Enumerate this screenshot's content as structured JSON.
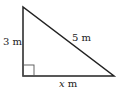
{
  "diagram": {
    "type": "right-triangle",
    "labels": {
      "vertical_side": "3 m",
      "hypotenuse": "5 m",
      "base_var": "x",
      "base_unit": " m"
    },
    "colors": {
      "stroke": "#222222",
      "right_angle_marker": "#555555",
      "background": "#ffffff"
    }
  }
}
